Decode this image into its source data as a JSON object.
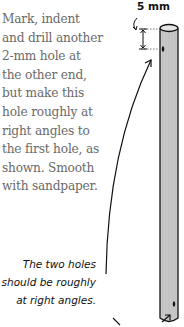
{
  "instructions": {
    "lines": [
      "Mark, indent",
      "and drill another",
      "2-mm hole at",
      "the other end,",
      "but make this",
      "hole roughly at",
      "right angles to",
      "the first hole, as",
      "shown. Smooth",
      "with sandpaper."
    ]
  },
  "note": {
    "lines": [
      "The two holes",
      "should be roughly",
      "at right angles."
    ]
  },
  "dimension": {
    "label": "5 mm"
  },
  "colors": {
    "dowel_fill": "#c8c8c8",
    "outline": "#111111",
    "body_text": "#6a6a6a"
  }
}
